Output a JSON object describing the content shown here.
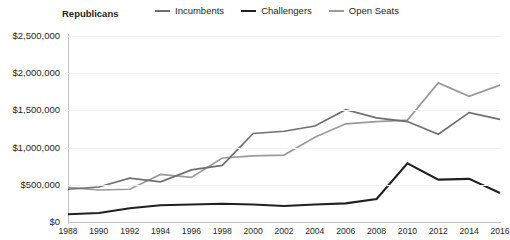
{
  "chart_data": {
    "type": "line",
    "title": "Republicans",
    "xlabel": "",
    "ylabel": "",
    "ylim": [
      0,
      2500000
    ],
    "ytick_values": [
      0,
      500000,
      1000000,
      1500000,
      2000000,
      2500000
    ],
    "ytick_labels": [
      "$0",
      "$500,000",
      "$1,000,000",
      "$1,500,000",
      "$2,000,000",
      "$2,500,000"
    ],
    "grid": true,
    "legend_position": "top",
    "categories": [
      1988,
      1990,
      1992,
      1994,
      1996,
      1998,
      2000,
      2002,
      2004,
      2006,
      2008,
      2010,
      2012,
      2014,
      2016
    ],
    "xtick_labels": [
      "1988",
      "1990",
      "1992",
      "1994",
      "1996",
      "1998",
      "2000",
      "2002",
      "2004",
      "2006",
      "2008",
      "2010",
      "2012",
      "2014",
      "2016"
    ],
    "series": [
      {
        "name": "Incumbents",
        "color": "#6f6f6f",
        "values": [
          440000,
          470000,
          590000,
          540000,
          700000,
          760000,
          1190000,
          1220000,
          1290000,
          1510000,
          1400000,
          1350000,
          1180000,
          1470000,
          1380000
        ]
      },
      {
        "name": "Challengers",
        "color": "#231f20",
        "values": [
          105000,
          120000,
          185000,
          225000,
          235000,
          245000,
          235000,
          215000,
          235000,
          250000,
          310000,
          790000,
          570000,
          580000,
          390000
        ]
      },
      {
        "name": "Open Seats",
        "color": "#9a9a9a",
        "values": [
          465000,
          430000,
          440000,
          640000,
          600000,
          860000,
          890000,
          900000,
          1140000,
          1320000,
          1350000,
          1370000,
          1870000,
          1690000,
          1840000
        ]
      }
    ]
  },
  "legend": {
    "items": [
      {
        "label": "Incumbents",
        "color": "#6f6f6f"
      },
      {
        "label": "Challengers",
        "color": "#231f20"
      },
      {
        "label": "Open Seats",
        "color": "#9a9a9a"
      }
    ]
  }
}
